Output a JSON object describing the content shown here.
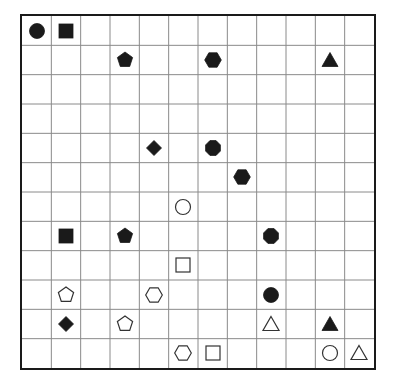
{
  "board": {
    "rows": 12,
    "cols": 12,
    "grid_color": "#8a8a8a",
    "border_color": "#1a1a1a",
    "fill_color": "#1a1a1a",
    "outline_color": "#333333",
    "pieces": [
      {
        "row": 0,
        "col": 0,
        "shape": "circle",
        "filled": true
      },
      {
        "row": 0,
        "col": 1,
        "shape": "square",
        "filled": true
      },
      {
        "row": 1,
        "col": 3,
        "shape": "pentagon",
        "filled": true
      },
      {
        "row": 1,
        "col": 6,
        "shape": "hexagon",
        "filled": true
      },
      {
        "row": 1,
        "col": 10,
        "shape": "triangle",
        "filled": true
      },
      {
        "row": 4,
        "col": 4,
        "shape": "diamond",
        "filled": true
      },
      {
        "row": 4,
        "col": 6,
        "shape": "octagon",
        "filled": true
      },
      {
        "row": 5,
        "col": 7,
        "shape": "hexagon",
        "filled": true
      },
      {
        "row": 6,
        "col": 5,
        "shape": "circle",
        "filled": false
      },
      {
        "row": 7,
        "col": 1,
        "shape": "square",
        "filled": true
      },
      {
        "row": 7,
        "col": 3,
        "shape": "pentagon",
        "filled": true
      },
      {
        "row": 7,
        "col": 8,
        "shape": "octagon",
        "filled": true
      },
      {
        "row": 8,
        "col": 5,
        "shape": "square",
        "filled": false
      },
      {
        "row": 9,
        "col": 1,
        "shape": "pentagon",
        "filled": false
      },
      {
        "row": 9,
        "col": 4,
        "shape": "hexagon",
        "filled": false
      },
      {
        "row": 9,
        "col": 8,
        "shape": "circle",
        "filled": true
      },
      {
        "row": 10,
        "col": 1,
        "shape": "diamond",
        "filled": true
      },
      {
        "row": 10,
        "col": 3,
        "shape": "pentagon",
        "filled": false
      },
      {
        "row": 10,
        "col": 8,
        "shape": "triangle",
        "filled": false
      },
      {
        "row": 10,
        "col": 10,
        "shape": "triangle",
        "filled": true
      },
      {
        "row": 11,
        "col": 5,
        "shape": "hexagon",
        "filled": false
      },
      {
        "row": 11,
        "col": 6,
        "shape": "square",
        "filled": false
      },
      {
        "row": 11,
        "col": 10,
        "shape": "circle",
        "filled": false
      },
      {
        "row": 11,
        "col": 11,
        "shape": "triangle",
        "filled": false
      }
    ]
  }
}
